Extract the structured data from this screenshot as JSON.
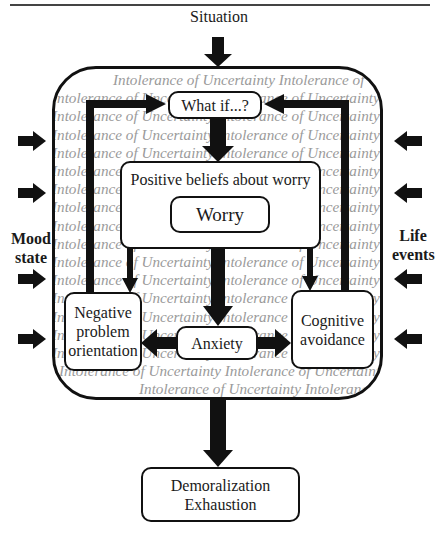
{
  "diagram": {
    "title_input": "Situation",
    "left_label": "Mood state",
    "left_label_lines": [
      "Mood",
      "state"
    ],
    "right_label_lines": [
      "Life",
      "events"
    ],
    "background_phrase": "Intolerance of Uncertainty",
    "background_lines": [
      "Intolerance of Uncertainty  Intolerance of",
      "Intolerance of Uncertainty Intolerance of Uncertainty",
      "Intolerance of Uncertainty Intolerance of Uncertainty",
      "Intolerance of Uncertainty Intolerance of Uncertainty",
      "Intolerance of Uncertainty Intolerance of Uncertainty",
      "Intolerance of Uncertainty Intolerance of Uncertainty",
      "Intolerance of Uncertainty Intolerance of Uncertainty",
      "Intolerance of Uncertainty Intolerance of Uncertainty",
      "Intolerance of Uncertainty Intolerance of Uncertainty",
      "Intolerance of Uncertainty Intolerance of Uncertainty",
      "Intolerance of Uncertainty Intolerance of Uncertainty",
      "Intolerance of Uncertainty Intolerance of Uncertainty",
      "Intolerance of Uncertainty Intolerance of Uncertainty",
      "Intolerance of Uncertainty Intolerance of Uncertainty",
      "Intolerance of Uncertainty Intolerance of Uncertainty",
      "Intolerance of Uncertainty Intolerance of Uncertainty",
      "Intolerance of Uncertainty Intolerance of Uncertainty",
      "Intolerance of Uncertainty  Intolerance of"
    ],
    "nodes": {
      "what_if": "What if...?",
      "positive_beliefs": "Positive beliefs about worry",
      "worry": "Worry",
      "negative_orientation": "Negative problem orientation",
      "anxiety": "Anxiety",
      "cognitive_avoidance": "Cognitive avoidance",
      "outcome_line1": "Demoralization",
      "outcome_line2": "Exhaustion"
    },
    "colors": {
      "stroke": "#111111",
      "background_text": "#9a9a9a"
    }
  }
}
